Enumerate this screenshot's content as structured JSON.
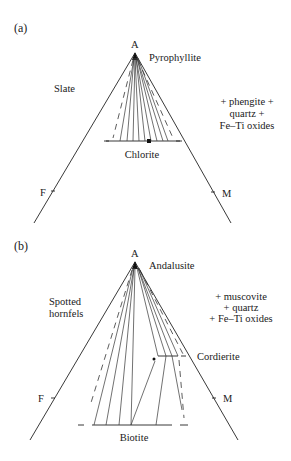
{
  "panels": [
    {
      "label": "(a)",
      "apex": "A",
      "left_vertex": "F",
      "right_vertex": "M",
      "rock_name": "Slate",
      "apex_phase": "Pyrophyllite",
      "base_phase": "Chlorite",
      "assemblage": [
        "+ phengite +",
        "quartz +",
        "Fe–Ti oxides"
      ]
    },
    {
      "label": "(b)",
      "apex": "A",
      "left_vertex": "F",
      "right_vertex": "M",
      "rock_name": [
        "Spotted",
        "hornfels"
      ],
      "apex_phase": "Andalusite",
      "mid_phase": "Cordierite",
      "base_phase": "Biotite",
      "assemblage": [
        "+ muscovite",
        "+ quartz",
        "+ Fe–Ti oxides"
      ]
    }
  ]
}
